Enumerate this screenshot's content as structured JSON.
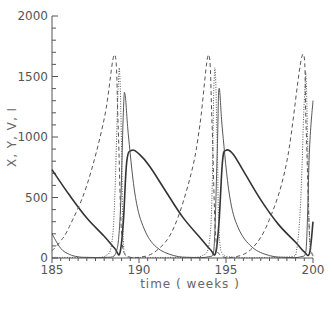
{
  "chart_data": {
    "type": "line",
    "title": "",
    "xlabel": "time ( weeks )",
    "ylabel": "X, Y, V, I",
    "xlim": [
      185,
      200
    ],
    "ylim": [
      0,
      2000
    ],
    "xticks": [
      185,
      190,
      195,
      200
    ],
    "yticks": [
      0,
      500,
      1000,
      1500,
      2000
    ],
    "grid": false,
    "legend": "none",
    "series": [
      {
        "name": "X",
        "style": "solid-thick",
        "x": [
          185,
          186,
          187,
          188,
          188.6,
          188.9,
          189.1,
          189.3,
          189.6,
          190.0,
          190.6,
          191.5,
          192.5,
          193.5,
          194.1,
          194.4,
          194.6,
          194.8,
          195.0,
          195.4,
          196.0,
          197.0,
          198.0,
          199.0,
          199.5,
          199.8,
          200.0
        ],
        "y": [
          730,
          520,
          330,
          180,
          80,
          40,
          300,
          800,
          890,
          860,
          760,
          560,
          340,
          170,
          70,
          40,
          300,
          800,
          890,
          860,
          720,
          480,
          280,
          130,
          50,
          40,
          300
        ]
      },
      {
        "name": "Y",
        "style": "solid-thin",
        "x": [
          185,
          185.5,
          186,
          186.5,
          187,
          188,
          188.6,
          188.9,
          189.1,
          189.2,
          189.4,
          189.8,
          190.3,
          191,
          192,
          193,
          194,
          194.3,
          194.5,
          194.6,
          194.8,
          195.2,
          195.7,
          196.5,
          197.5,
          198.5,
          199.3,
          199.6,
          199.8,
          200
        ],
        "y": [
          200,
          80,
          30,
          10,
          5,
          5,
          20,
          300,
          1200,
          1350,
          1000,
          500,
          240,
          90,
          20,
          5,
          10,
          60,
          900,
          1400,
          1050,
          520,
          250,
          90,
          20,
          5,
          10,
          60,
          900,
          1300
        ]
      },
      {
        "name": "V",
        "style": "dashed",
        "x": [
          185,
          185.5,
          186,
          187,
          188,
          188.6,
          188.8,
          189.0,
          189.3,
          190,
          191,
          192,
          193,
          193.5,
          194.0,
          194.2,
          194.4,
          194.7,
          195.4,
          196.5,
          197.5,
          198.5,
          199.4,
          199.6,
          199.8,
          200
        ],
        "y": [
          60,
          140,
          260,
          600,
          1150,
          1680,
          1100,
          200,
          20,
          5,
          60,
          250,
          700,
          1100,
          1680,
          1100,
          200,
          20,
          5,
          80,
          320,
          800,
          1680,
          1100,
          200,
          20
        ]
      },
      {
        "name": "I",
        "style": "dotted",
        "x": [
          185,
          187,
          188,
          188.5,
          188.8,
          188.9,
          189.0,
          189.1,
          189.3,
          190,
          192,
          193.5,
          194.1,
          194.3,
          194.4,
          194.5,
          194.7,
          195.5,
          197.5,
          199.0,
          199.5,
          199.6,
          199.7,
          199.8,
          200
        ],
        "y": [
          5,
          5,
          10,
          200,
          1400,
          1500,
          900,
          150,
          10,
          5,
          5,
          10,
          200,
          1400,
          1500,
          900,
          60,
          5,
          5,
          20,
          1300,
          1500,
          900,
          150,
          10
        ]
      }
    ]
  }
}
